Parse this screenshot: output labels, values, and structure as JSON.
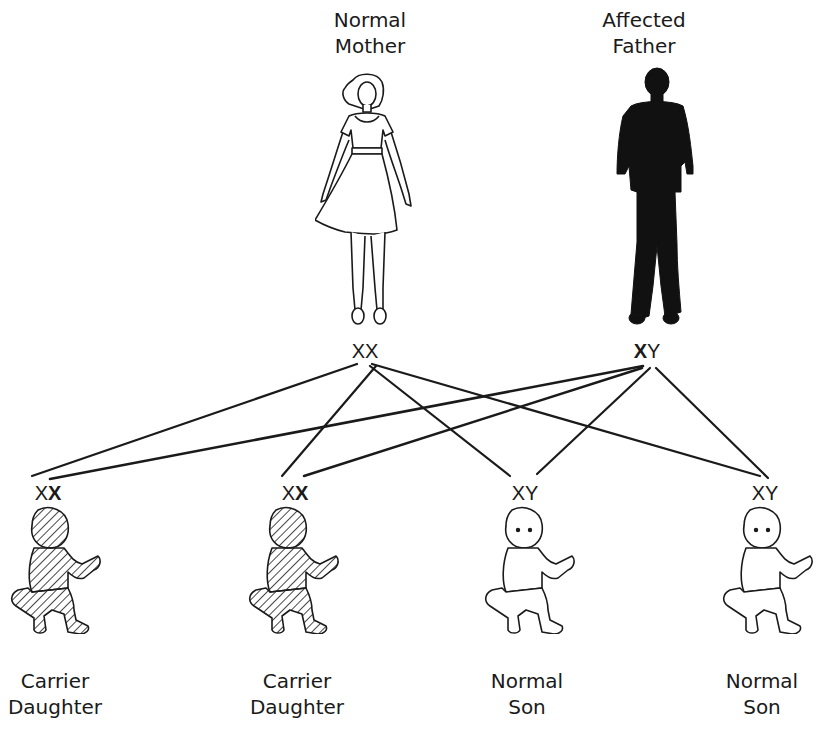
{
  "parents": {
    "mother": {
      "label_line1": "Normal",
      "label_line2": "Mother",
      "genotype": [
        "X",
        "X"
      ],
      "genotype_bold": [
        false,
        false
      ],
      "icon": "woman-outline-figure"
    },
    "father": {
      "label_line1": "Affected",
      "label_line2": "Father",
      "genotype": [
        "X",
        "Y"
      ],
      "genotype_bold": [
        true,
        false
      ],
      "icon": "man-silhouette-figure"
    }
  },
  "children": [
    {
      "label_line1": "Carrier",
      "label_line2": "Daughter",
      "genotype": [
        "X",
        "X"
      ],
      "genotype_bold": [
        false,
        true
      ],
      "hatched": true,
      "icon": "baby-hatched-figure"
    },
    {
      "label_line1": "Carrier",
      "label_line2": "Daughter",
      "genotype": [
        "X",
        "X"
      ],
      "genotype_bold": [
        false,
        true
      ],
      "hatched": true,
      "icon": "baby-hatched-figure"
    },
    {
      "label_line1": "Normal",
      "label_line2": "Son",
      "genotype": [
        "X",
        "Y"
      ],
      "genotype_bold": [
        false,
        false
      ],
      "hatched": false,
      "icon": "baby-outline-figure"
    },
    {
      "label_line1": "Normal",
      "label_line2": "Son",
      "genotype": [
        "X",
        "Y"
      ],
      "genotype_bold": [
        false,
        false
      ],
      "hatched": false,
      "icon": "baby-outline-figure"
    }
  ],
  "colors": {
    "ink": "#1a1a1a",
    "background": "#ffffff",
    "affected_fill": "#111111"
  }
}
